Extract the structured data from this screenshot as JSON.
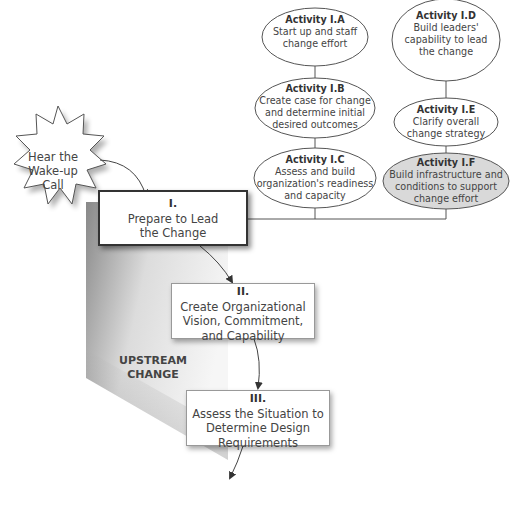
{
  "trigger": {
    "label_line1": "Hear the",
    "label_line2": "Wake-up",
    "label_line3": "Call"
  },
  "phases": [
    {
      "number": "I.",
      "line1": "Prepare to Lead",
      "line2": "the Change",
      "line3": ""
    },
    {
      "number": "II.",
      "line1": "Create Organizational",
      "line2": "Vision, Commitment,",
      "line3": "and Capability"
    },
    {
      "number": "III.",
      "line1": "Assess the Situation to",
      "line2": "Determine Design",
      "line3": "Requirements"
    }
  ],
  "activities": [
    {
      "title": "Activity I.A",
      "line1": "Start up and staff",
      "line2": "change effort",
      "line3": ""
    },
    {
      "title": "Activity I.B",
      "line1": "Create case for change",
      "line2": "and determine initial",
      "line3": "desired outcomes"
    },
    {
      "title": "Activity I.C",
      "line1": "Assess and build",
      "line2": "organization's readiness",
      "line3": "and capacity"
    },
    {
      "title": "Activity I.D",
      "line1": "Build leaders'",
      "line2": "capability to lead",
      "line3": "the change"
    },
    {
      "title": "Activity I.E",
      "line1": "Clarify overall",
      "line2": "change strategy",
      "line3": ""
    },
    {
      "title": "Activity I.F",
      "line1": "Build infrastructure and",
      "line2": "conditions to support",
      "line3": "change effort"
    }
  ],
  "region_label": {
    "line1": "UPSTREAM",
    "line2": "CHANGE"
  },
  "colors": {
    "highlight_ellipse": "#d9d9d9",
    "wedge_dark": "#8a8a8a",
    "wedge_light": "#f2f2f2",
    "line": "#555555"
  }
}
